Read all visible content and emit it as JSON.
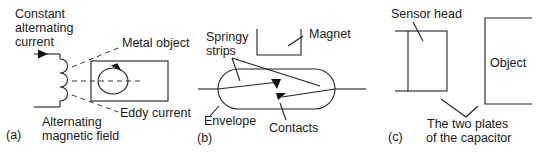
{
  "panel_a": {
    "tag": "(a)",
    "label_source_1": "Constant",
    "label_source_2": "alternating",
    "label_source_3": "current",
    "label_metal": "Metal object",
    "label_eddy": "Eddy current",
    "label_field_1": "Alternating",
    "label_field_2": "magnetic field"
  },
  "panel_b": {
    "tag": "(b)",
    "label_strips_1": "Springy",
    "label_strips_2": "strips",
    "label_magnet": "Magnet",
    "label_envelope": "Envelope",
    "label_contacts": "Contacts"
  },
  "panel_c": {
    "tag": "(c)",
    "label_sensor": "Sensor head",
    "label_object": "Object",
    "label_plates_1": "The two plates",
    "label_plates_2": "of the capacitor"
  }
}
